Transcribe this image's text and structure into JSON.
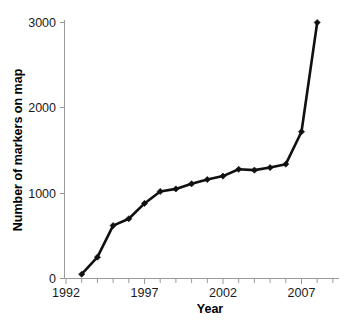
{
  "chart_data": {
    "type": "line",
    "title": "",
    "xlabel": "Year",
    "ylabel": "Number of markers on map",
    "xlim": [
      1992,
      2008.5
    ],
    "ylim": [
      0,
      3150
    ],
    "grid": false,
    "legend": null,
    "x_tick_labels": [
      "1992",
      "1997",
      "2002",
      "2007"
    ],
    "x_tick_values": [
      1992,
      1997,
      2002,
      2007
    ],
    "x_minor_tick_values": [
      1993,
      1994,
      1995,
      1996,
      1998,
      1999,
      2000,
      2001,
      2003,
      2004,
      2005,
      2006,
      2008
    ],
    "y_tick_labels": [
      "0",
      "1000",
      "2000",
      "3000"
    ],
    "y_tick_values": [
      0,
      1000,
      2000,
      3000
    ],
    "marker": "diamond",
    "line_color": "#101010",
    "marker_color": "#101010",
    "x": [
      1993,
      1994,
      1995,
      1996,
      1997,
      1998,
      1999,
      2000,
      2001,
      2002,
      2003,
      2004,
      2005,
      2006,
      2007,
      2008
    ],
    "values": [
      50,
      250,
      620,
      700,
      880,
      1020,
      1050,
      1110,
      1160,
      1200,
      1280,
      1270,
      1300,
      1340,
      1720,
      3000
    ],
    "series": [
      {
        "name": "Number of markers on map",
        "x": [
          1993,
          1994,
          1995,
          1996,
          1997,
          1998,
          1999,
          2000,
          2001,
          2002,
          2003,
          2004,
          2005,
          2006,
          2007,
          2008
        ],
        "values": [
          50,
          250,
          620,
          700,
          880,
          1020,
          1050,
          1110,
          1160,
          1200,
          1280,
          1270,
          1300,
          1340,
          1720,
          3000
        ]
      }
    ]
  },
  "axes": {
    "y_title": "Number of markers on map",
    "x_title": "Year"
  }
}
